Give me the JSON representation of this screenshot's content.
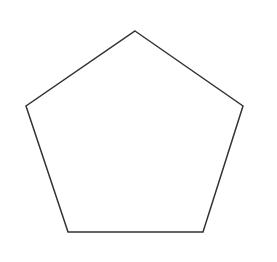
{
  "canvas": {
    "width": 277,
    "height": 262,
    "background_color": "#ffffff",
    "description": "Plain white image containing a single outlined regular pentagon"
  },
  "shape": {
    "name": "pentagon",
    "sides": 5,
    "type": "regular-polygon",
    "orientation": "point-up",
    "fill": "none",
    "fill_color": "#ffffff",
    "stroke_color": "#333333",
    "stroke_width": 1.5,
    "closed": true,
    "vertices": [
      {
        "label": "top-apex",
        "x": 135,
        "y": 31
      },
      {
        "label": "right-upper",
        "x": 243,
        "y": 106
      },
      {
        "label": "bottom-right",
        "x": 203,
        "y": 232
      },
      {
        "label": "bottom-left",
        "x": 68,
        "y": 232
      },
      {
        "label": "left-upper",
        "x": 26,
        "y": 106
      }
    ],
    "points_attr": "135,31 243,106 203,232 68,232 26,106",
    "bounding_box": {
      "x": 26,
      "y": 31,
      "width": 217,
      "height": 201
    },
    "center": {
      "x": 135,
      "y": 144
    }
  },
  "labels": {
    "text_present": false,
    "items": []
  }
}
